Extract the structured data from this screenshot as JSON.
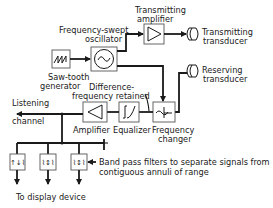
{
  "diagram": {
    "blocks": {
      "sawtooth": {
        "label_line1": "Saw-tooth",
        "label_line2": "generator",
        "icon": "sawtooth-wave-icon"
      },
      "oscillator": {
        "label_line1": "Frequency-swept",
        "label_line2": "oscillator",
        "icon": "sine-wave-icon"
      },
      "tx_amplifier": {
        "label_line1": "Transmitting",
        "label_line2": "amplifier",
        "icon": "amplifier-triangle-icon"
      },
      "tx_transducer": {
        "label_line1": "Transmitting",
        "label_line2": "transducer",
        "icon": "transducer-icon"
      },
      "rx_transducer": {
        "label_line1": "Reserving",
        "label_line2": "transducer",
        "icon": "transducer-icon"
      },
      "freq_changer": {
        "label_line1": "Frequency",
        "label_line2": "changer",
        "icon": "mixer-icon"
      },
      "equalizer": {
        "label": "Equalizer",
        "icon": "equalizer-curve-icon"
      },
      "amplifier": {
        "label": "Amplifier",
        "icon": "amplifier-triangle-icon"
      },
      "filters": {
        "count": 3,
        "icon": "bandpass-filter-icon"
      }
    },
    "annotations": {
      "difference_line1": "Difference-",
      "difference_line2": "frequency retained",
      "listening_line1": "Listening",
      "listening_line2": "channel",
      "bandpass_line1": "Band pass filters to separate signals from",
      "bandpass_line2": "contiguous annuli of range",
      "display": "To display device"
    }
  }
}
